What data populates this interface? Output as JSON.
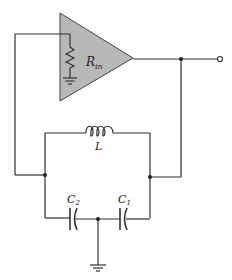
{
  "diagram": {
    "type": "circuit",
    "amplifier": {
      "label": "R",
      "label_subscript": "in",
      "fill_color": "#b8b8b8"
    },
    "components": {
      "inductor": {
        "label": "L"
      },
      "capacitor_2": {
        "label": "C",
        "subscript": "2"
      },
      "capacitor_1": {
        "label": "C",
        "subscript": "1"
      }
    },
    "colors": {
      "wire": "#333333",
      "background": "#ffffff"
    }
  }
}
